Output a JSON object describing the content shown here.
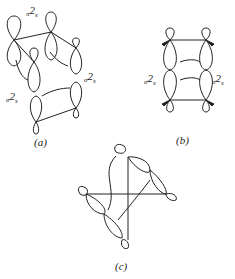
{
  "figure": {
    "panels": [
      {
        "id": "a",
        "caption": "(a)",
        "labels": [
          {
            "pre": "π",
            "main": "2",
            "sub": "s"
          },
          {
            "pre": "σ",
            "main": "2",
            "sub": "s"
          },
          {
            "pre": "σ",
            "main": "2",
            "sub": "s"
          }
        ]
      },
      {
        "id": "b",
        "caption": "(b)",
        "labels": [
          {
            "pre": "σ",
            "main": "2",
            "sub": "s"
          },
          {
            "pre": "σ",
            "main": "2",
            "sub": "s"
          }
        ]
      },
      {
        "id": "c",
        "caption": "(c)",
        "labels": []
      }
    ]
  },
  "colors": {
    "ink": "#222222",
    "background": "#ffffff"
  }
}
